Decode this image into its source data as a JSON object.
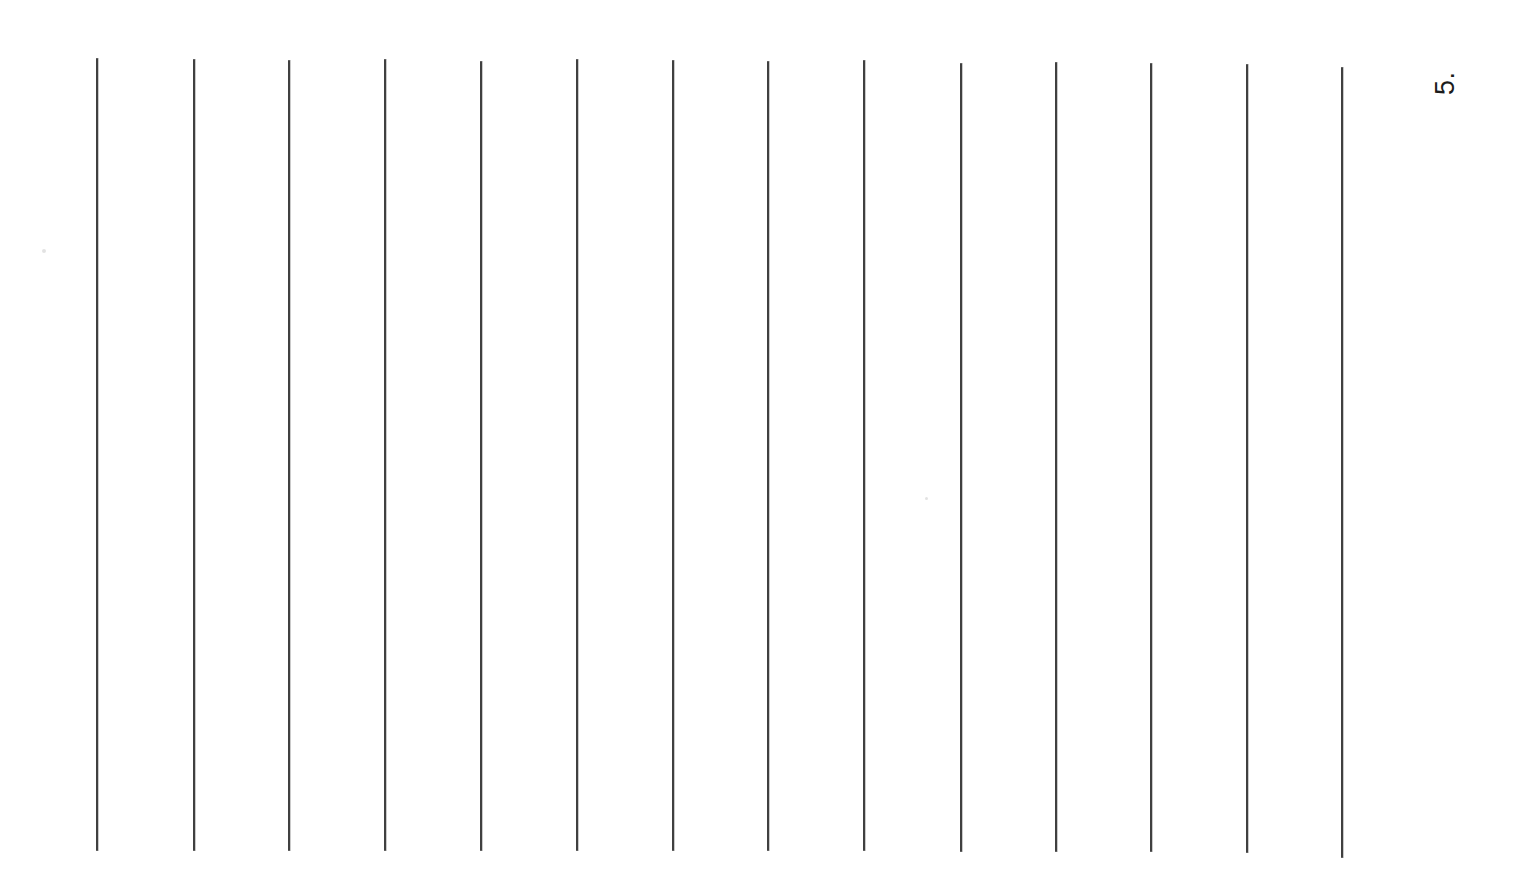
{
  "page": {
    "background_color": "#ffffff",
    "width": 1515,
    "height": 877,
    "orientation_note": "landscape scan of a portrait page rotated 90 degrees"
  },
  "page_number": {
    "label": "5.",
    "color": "#1c1c1c",
    "rotation_degrees": -90,
    "x": 1432,
    "y": 95,
    "font_size": 27
  },
  "ruling": {
    "line_color": "#3a3a3a",
    "line_width": 2,
    "count": 14,
    "lines": [
      {
        "index": 1,
        "x": 97,
        "top": 58,
        "bottom": 851
      },
      {
        "index": 2,
        "x": 194,
        "top": 59,
        "bottom": 851
      },
      {
        "index": 3,
        "x": 289,
        "top": 60,
        "bottom": 851
      },
      {
        "index": 4,
        "x": 385,
        "top": 59,
        "bottom": 851
      },
      {
        "index": 5,
        "x": 481,
        "top": 61,
        "bottom": 851
      },
      {
        "index": 6,
        "x": 577,
        "top": 59,
        "bottom": 851
      },
      {
        "index": 7,
        "x": 673,
        "top": 60,
        "bottom": 851
      },
      {
        "index": 8,
        "x": 768,
        "top": 61,
        "bottom": 851
      },
      {
        "index": 9,
        "x": 864,
        "top": 60,
        "bottom": 851
      },
      {
        "index": 10,
        "x": 961,
        "top": 63,
        "bottom": 852
      },
      {
        "index": 11,
        "x": 1056,
        "top": 62,
        "bottom": 852
      },
      {
        "index": 12,
        "x": 1151,
        "top": 63,
        "bottom": 852
      },
      {
        "index": 13,
        "x": 1247,
        "top": 64,
        "bottom": 853
      },
      {
        "index": 14,
        "x": 1342,
        "top": 67,
        "bottom": 858
      }
    ]
  },
  "artifacts": {
    "specks": [
      {
        "x": 42,
        "y": 249,
        "size": 4
      },
      {
        "x": 925,
        "y": 497,
        "size": 3
      }
    ]
  }
}
